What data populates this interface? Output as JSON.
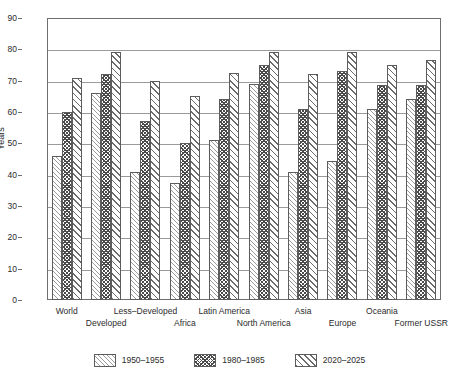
{
  "chart_data": {
    "type": "bar",
    "title": "",
    "xlabel": "",
    "ylabel": "Years",
    "ylim": [
      0,
      90
    ],
    "ytick_step": 10,
    "yticks": [
      0,
      10,
      20,
      30,
      40,
      50,
      60,
      70,
      80,
      90
    ],
    "grid": true,
    "legend_position": "bottom",
    "categories": [
      "World",
      "Developed",
      "Less–Developed",
      "Africa",
      "Latin America",
      "North America",
      "Asia",
      "Europe",
      "Oceania",
      "Former USSR"
    ],
    "series": [
      {
        "name": "1950–1955",
        "pattern": "fine-diagonal-hatch",
        "values": [
          46,
          66,
          41,
          37.5,
          51,
          69,
          41,
          44.5,
          61,
          64
        ]
      },
      {
        "name": "1980–1985",
        "pattern": "dense-crosshatch",
        "values": [
          60,
          72,
          57,
          50,
          64,
          75,
          61,
          73,
          68.5,
          68.5
        ]
      },
      {
        "name": "2020–2025",
        "pattern": "wide-diagonal-hatch",
        "values": [
          71,
          79,
          70,
          65,
          72.5,
          79,
          72,
          79,
          75,
          76.5
        ]
      }
    ]
  },
  "axis": {
    "y_title": "Years"
  },
  "colors": {
    "frame": "#6f6f6f",
    "gridline": "#9a9a9a",
    "bar_outline": "#5c5c5c",
    "text": "#2b2b2b",
    "background": "#ffffff"
  }
}
